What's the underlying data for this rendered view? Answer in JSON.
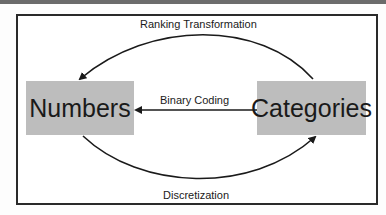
{
  "diagram": {
    "nodes": [
      {
        "id": "numbers",
        "label": "Numbers"
      },
      {
        "id": "categories",
        "label": "Categories"
      }
    ],
    "edges": [
      {
        "from": "categories",
        "to": "numbers",
        "label": "Ranking Transformation",
        "shape": "curve-top"
      },
      {
        "from": "categories",
        "to": "numbers",
        "label": "Binary Coding",
        "shape": "straight"
      },
      {
        "from": "numbers",
        "to": "categories",
        "label": "Discretization",
        "shape": "curve-bottom"
      }
    ]
  },
  "colors": {
    "node_fill": "#bdbdbd",
    "line": "#1a1a1a",
    "frame": "#2a2a2a",
    "top_bar": "#6b6b6b"
  }
}
